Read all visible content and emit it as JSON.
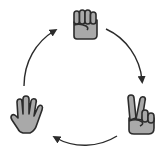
{
  "diagram": {
    "type": "cycle",
    "nodes": [
      {
        "id": "rock",
        "label": "Rock",
        "icon": "fist-icon",
        "position": "top"
      },
      {
        "id": "scissors",
        "label": "Scissors",
        "icon": "v-sign-icon",
        "position": "bottom-right"
      },
      {
        "id": "paper",
        "label": "Paper",
        "icon": "open-hand-icon",
        "position": "bottom-left"
      }
    ],
    "edges": [
      {
        "from": "rock",
        "to": "scissors",
        "direction": "clockwise"
      },
      {
        "from": "scissors",
        "to": "paper",
        "direction": "clockwise"
      },
      {
        "from": "paper",
        "to": "rock",
        "direction": "clockwise"
      }
    ],
    "colors": {
      "hand_fill": "#a9a9a9",
      "outline": "#2b2b2b",
      "arrow": "#2b2b2b",
      "background": "#ffffff"
    }
  }
}
